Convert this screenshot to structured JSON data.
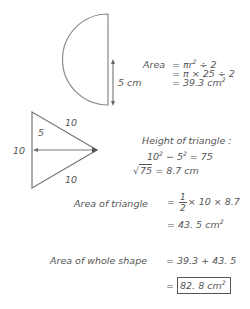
{
  "semicircle": {
    "radius_label": "5 cm",
    "area_label": "Area",
    "line1": "= πr",
    "line1_exp": "2",
    "line1_tail": " ÷ 2",
    "line2": "= π × 25 ÷  2",
    "line3": "= 39.3 cm",
    "line3_exp": "2"
  },
  "triangle": {
    "side_top": "10",
    "side_bottom": "10",
    "side_left": "10",
    "half_base": "5",
    "height_heading": "Height of triangle  :",
    "pyth_a": "10",
    "pyth_a_exp": "2",
    "pyth_mid": " − 5",
    "pyth_b_exp": "2",
    "pyth_tail": " = 75",
    "sqrt_radicand": "75",
    "sqrt_tail": " = 8.7  cm",
    "area_label": "Area of triangle",
    "area_eq_prefix": "=",
    "frac_num": "1",
    "frac_den": "2",
    "area_eq_tail": "× 10 × 8.7",
    "area_result": "= 43. 5 cm",
    "area_result_exp": "2"
  },
  "whole": {
    "label": "Area of whole shape",
    "sum": "= 39.3 + 43.  5",
    "eq": "=",
    "answer": "82. 8 cm",
    "answer_exp": "2"
  },
  "colors": {
    "stroke": "#8a8a8a",
    "text": "#555555"
  }
}
